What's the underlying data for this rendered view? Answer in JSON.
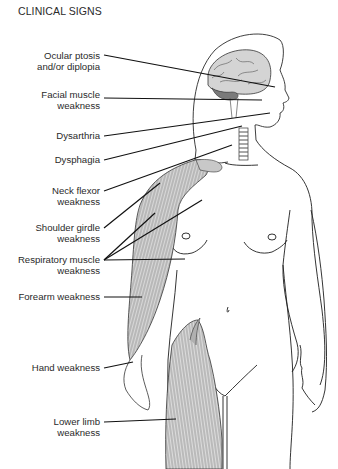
{
  "title": "CLINICAL SIGNS",
  "labels": [
    {
      "id": "ocular",
      "line1": "Ocular ptosis",
      "line2": "and/or diplopia"
    },
    {
      "id": "facial",
      "line1": "Facial muscle",
      "line2": "weakness"
    },
    {
      "id": "dysarthria",
      "line1": "Dysarthria",
      "line2": ""
    },
    {
      "id": "dysphagia",
      "line1": "Dysphagia",
      "line2": ""
    },
    {
      "id": "neck",
      "line1": "Neck flexor",
      "line2": "weakness"
    },
    {
      "id": "shoulder",
      "line1": "Shoulder girdle",
      "line2": "weakness"
    },
    {
      "id": "respiratory",
      "line1": "Respiratory muscle",
      "line2": "weakness"
    },
    {
      "id": "forearm",
      "line1": "Forearm weakness",
      "line2": ""
    },
    {
      "id": "hand",
      "line1": "Hand weakness",
      "line2": ""
    },
    {
      "id": "lowerlimb",
      "line1": "Lower limb",
      "line2": "weakness"
    }
  ],
  "colors": {
    "line": "#1a1a1a",
    "muscle": "#9a9a9a",
    "brain": "#bdbdbd",
    "cerebellum": "#777777"
  }
}
